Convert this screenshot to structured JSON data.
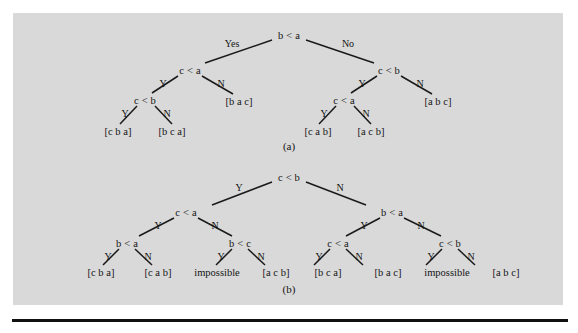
{
  "figure": {
    "background_color": "#d9d9d9",
    "page_color": "#ffffff",
    "ink_color": "#141414",
    "captions": [
      {
        "text": "(a)",
        "x": 289,
        "y": 146
      },
      {
        "text": "(b)",
        "x": 289,
        "y": 289
      }
    ]
  },
  "trees": [
    {
      "id": "tree-a",
      "caption": "(a)",
      "nodes": [
        {
          "name": "root",
          "text": "b < a",
          "x": 289,
          "y": 35
        },
        {
          "name": "a-L",
          "text": "c < a",
          "x": 190,
          "y": 70
        },
        {
          "name": "a-R",
          "text": "c < b",
          "x": 389,
          "y": 70
        },
        {
          "name": "a-LL",
          "text": "c < b",
          "x": 145,
          "y": 100
        },
        {
          "name": "a-RL",
          "text": "c < a",
          "x": 344,
          "y": 100
        }
      ],
      "edge_labels": [
        {
          "name": "root-yes",
          "text": "Yes",
          "x": 232,
          "y": 43
        },
        {
          "name": "root-no",
          "text": "No",
          "x": 348,
          "y": 43
        },
        {
          "name": "a-L-y",
          "text": "Y",
          "x": 163,
          "y": 83
        },
        {
          "name": "a-L-n",
          "text": "N",
          "x": 221,
          "y": 83
        },
        {
          "name": "a-R-y",
          "text": "Y",
          "x": 362,
          "y": 83
        },
        {
          "name": "a-R-n",
          "text": "N",
          "x": 420,
          "y": 83
        },
        {
          "name": "a-LL-y",
          "text": "Y",
          "x": 125,
          "y": 113
        },
        {
          "name": "a-LL-n",
          "text": "N",
          "x": 167,
          "y": 113
        },
        {
          "name": "a-RL-y",
          "text": "Y",
          "x": 324,
          "y": 113
        },
        {
          "name": "a-RL-n",
          "text": "N",
          "x": 366,
          "y": 113
        }
      ],
      "leaves": [
        {
          "name": "a-leaf-1",
          "text": "[c b a]",
          "x": 118,
          "y": 131
        },
        {
          "name": "a-leaf-2",
          "text": "[b c a]",
          "x": 172,
          "y": 131
        },
        {
          "name": "a-leaf-3",
          "text": "[b a c]",
          "x": 239,
          "y": 101
        },
        {
          "name": "a-leaf-4",
          "text": "[c a b]",
          "x": 318,
          "y": 131
        },
        {
          "name": "a-leaf-5",
          "text": "[a c b]",
          "x": 371,
          "y": 131
        },
        {
          "name": "a-leaf-6",
          "text": "[a b c]",
          "x": 438,
          "y": 101
        }
      ],
      "edges": [
        {
          "x1": 272,
          "y1": 40,
          "x2": 205,
          "y2": 63
        },
        {
          "x1": 306,
          "y1": 40,
          "x2": 374,
          "y2": 63
        },
        {
          "x1": 178,
          "y1": 76,
          "x2": 152,
          "y2": 93
        },
        {
          "x1": 202,
          "y1": 76,
          "x2": 233,
          "y2": 94
        },
        {
          "x1": 377,
          "y1": 76,
          "x2": 351,
          "y2": 93
        },
        {
          "x1": 401,
          "y1": 76,
          "x2": 432,
          "y2": 94
        },
        {
          "x1": 137,
          "y1": 106,
          "x2": 120,
          "y2": 124
        },
        {
          "x1": 155,
          "y1": 106,
          "x2": 172,
          "y2": 124
        },
        {
          "x1": 336,
          "y1": 106,
          "x2": 319,
          "y2": 124
        },
        {
          "x1": 354,
          "y1": 106,
          "x2": 371,
          "y2": 124
        }
      ]
    },
    {
      "id": "tree-b",
      "caption": "(b)",
      "nodes": [
        {
          "name": "root",
          "text": "c < b",
          "x": 289,
          "y": 177
        },
        {
          "name": "b-L",
          "text": "c < a",
          "x": 186,
          "y": 212
        },
        {
          "name": "b-R",
          "text": "b < a",
          "x": 392,
          "y": 212
        },
        {
          "name": "b-LL",
          "text": "b < a",
          "x": 127,
          "y": 243
        },
        {
          "name": "b-LR",
          "text": "b < c",
          "x": 240,
          "y": 243
        },
        {
          "name": "b-RL",
          "text": "c < a",
          "x": 338,
          "y": 243
        },
        {
          "name": "b-RR",
          "text": "c < b",
          "x": 450,
          "y": 243
        }
      ],
      "edge_labels": [
        {
          "name": "b-root-y",
          "text": "Y",
          "x": 239,
          "y": 187
        },
        {
          "name": "b-root-n",
          "text": "N",
          "x": 340,
          "y": 187
        },
        {
          "name": "b-L-y",
          "text": "Y",
          "x": 158,
          "y": 225
        },
        {
          "name": "b-L-n",
          "text": "N",
          "x": 215,
          "y": 225
        },
        {
          "name": "b-R-y",
          "text": "Y",
          "x": 364,
          "y": 225
        },
        {
          "name": "b-R-n",
          "text": "N",
          "x": 421,
          "y": 225
        },
        {
          "name": "b-LL-y",
          "text": "Y",
          "x": 108,
          "y": 256
        },
        {
          "name": "b-LL-n",
          "text": "N",
          "x": 148,
          "y": 256
        },
        {
          "name": "b-LR-y",
          "text": "Y",
          "x": 221,
          "y": 256
        },
        {
          "name": "b-LR-n",
          "text": "N",
          "x": 261,
          "y": 256
        },
        {
          "name": "b-RL-y",
          "text": "Y",
          "x": 319,
          "y": 256
        },
        {
          "name": "b-RL-n",
          "text": "N",
          "x": 359,
          "y": 256
        },
        {
          "name": "b-RR-y",
          "text": "Y",
          "x": 431,
          "y": 256
        },
        {
          "name": "b-RR-n",
          "text": "N",
          "x": 471,
          "y": 256
        }
      ],
      "leaves": [
        {
          "name": "b-leaf-1",
          "text": "[c b a]",
          "x": 101,
          "y": 272
        },
        {
          "name": "b-leaf-2",
          "text": "[c a b]",
          "x": 158,
          "y": 272
        },
        {
          "name": "b-leaf-3",
          "text": "impossible",
          "x": 217,
          "y": 272
        },
        {
          "name": "b-leaf-4",
          "text": "[a c b]",
          "x": 276,
          "y": 272
        },
        {
          "name": "b-leaf-5",
          "text": "[b c a]",
          "x": 328,
          "y": 272
        },
        {
          "name": "b-leaf-6",
          "text": "[b a c]",
          "x": 388,
          "y": 272
        },
        {
          "name": "b-leaf-7",
          "text": "impossible",
          "x": 447,
          "y": 272
        },
        {
          "name": "b-leaf-8",
          "text": "[a b c]",
          "x": 506,
          "y": 272
        }
      ],
      "edges": [
        {
          "x1": 272,
          "y1": 182,
          "x2": 212,
          "y2": 205
        },
        {
          "x1": 306,
          "y1": 182,
          "x2": 366,
          "y2": 205
        },
        {
          "x1": 174,
          "y1": 218,
          "x2": 139,
          "y2": 236
        },
        {
          "x1": 198,
          "y1": 218,
          "x2": 232,
          "y2": 236
        },
        {
          "x1": 380,
          "y1": 218,
          "x2": 346,
          "y2": 236
        },
        {
          "x1": 404,
          "y1": 218,
          "x2": 441,
          "y2": 236
        },
        {
          "x1": 119,
          "y1": 249,
          "x2": 103,
          "y2": 265
        },
        {
          "x1": 135,
          "y1": 249,
          "x2": 152,
          "y2": 265
        },
        {
          "x1": 232,
          "y1": 249,
          "x2": 216,
          "y2": 265
        },
        {
          "x1": 248,
          "y1": 249,
          "x2": 265,
          "y2": 265
        },
        {
          "x1": 330,
          "y1": 249,
          "x2": 314,
          "y2": 265
        },
        {
          "x1": 346,
          "y1": 249,
          "x2": 363,
          "y2": 265
        },
        {
          "x1": 442,
          "y1": 249,
          "x2": 426,
          "y2": 265
        },
        {
          "x1": 458,
          "y1": 249,
          "x2": 475,
          "y2": 265
        }
      ]
    }
  ]
}
